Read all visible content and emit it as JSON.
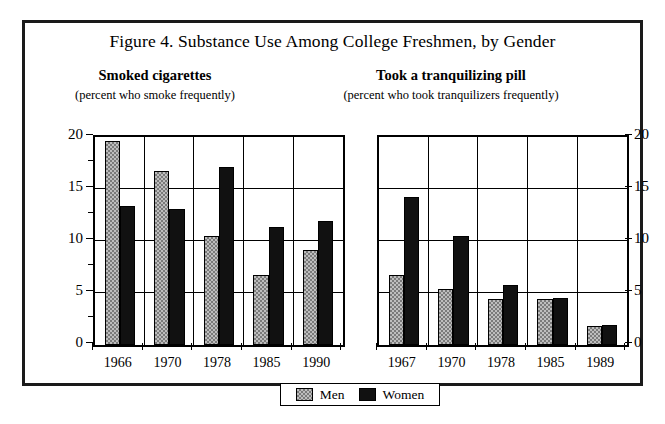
{
  "figure": {
    "caption": "Figure 4. Substance Use Among College Freshmen, by Gender"
  },
  "legend": {
    "entries": [
      {
        "label": "Men",
        "key": "men",
        "swatch": "gray-checkered-swatch"
      },
      {
        "label": "Women",
        "key": "women",
        "swatch": "solid-black-swatch"
      }
    ]
  },
  "chart_data": [
    {
      "type": "bar",
      "id": "smoked-cigarettes",
      "title": "Smoked cigarettes",
      "subtitle": "(percent who smoke frequently)",
      "xlabel": "",
      "ylabel": "",
      "ylim": [
        0,
        20
      ],
      "yticks": [
        0,
        5,
        10,
        15,
        20
      ],
      "ytick_labels": [
        "0",
        "5",
        "10",
        "15",
        "20"
      ],
      "y_axis_side": "left",
      "grid": "both",
      "categories": [
        "1966",
        "1970",
        "1978",
        "1985",
        "1990"
      ],
      "series": [
        {
          "name": "Men",
          "values": [
            19.6,
            16.7,
            10.5,
            6.7,
            9.1
          ]
        },
        {
          "name": "Women",
          "values": [
            13.4,
            13.1,
            17.1,
            11.3,
            11.9
          ]
        }
      ]
    },
    {
      "type": "bar",
      "id": "took-tranquilizing-pill",
      "title": "Took a tranquilizing pill",
      "subtitle": "(percent who took tranquilizers frequently)",
      "xlabel": "",
      "ylabel": "",
      "ylim": [
        0,
        20
      ],
      "yticks": [
        0,
        5,
        10,
        15,
        20
      ],
      "ytick_labels": [
        "0",
        "5",
        "10",
        "15",
        "20"
      ],
      "y_axis_side": "right",
      "grid": "both",
      "categories": [
        "1967",
        "1970",
        "1978",
        "1985",
        "1989"
      ],
      "series": [
        {
          "name": "Men",
          "values": [
            6.7,
            5.4,
            4.4,
            4.4,
            1.8
          ]
        },
        {
          "name": "Women",
          "values": [
            14.2,
            10.5,
            5.8,
            4.5,
            1.9
          ]
        }
      ]
    }
  ]
}
